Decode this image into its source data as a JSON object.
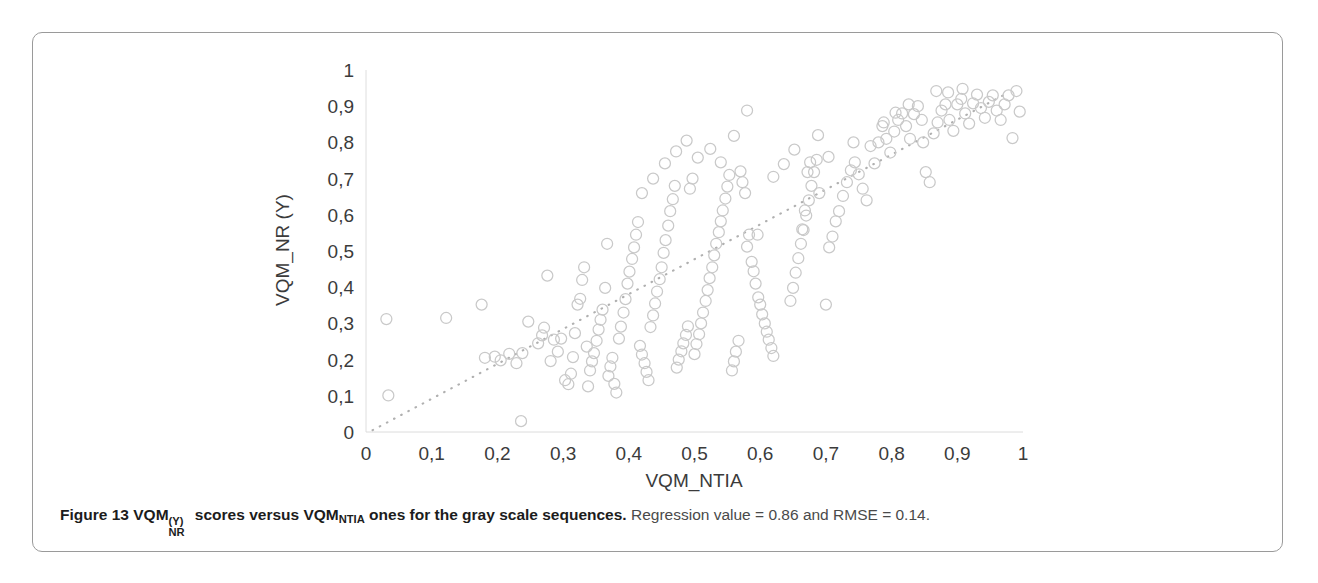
{
  "figure": {
    "caption_bold_prefix": "Figure 13",
    "caption_metric_main": "VQM",
    "caption_metric_sub": "NR",
    "caption_metric_sup": "(Y)",
    "caption_mid": " scores versus VQM",
    "caption_mid_sub": "NTIA",
    "caption_bold_tail": " ones for the gray scale sequences.",
    "caption_rest": " Regression value = 0.86 and RMSE = 0.14."
  },
  "chart_data": {
    "type": "scatter",
    "title": "",
    "xlabel": "VQM_NTIA",
    "ylabel": "VQM_NR (Y)",
    "xlim": [
      0,
      1
    ],
    "ylim": [
      0,
      1
    ],
    "xticks": [
      "0",
      "0,1",
      "0,2",
      "0,3",
      "0,4",
      "0,5",
      "0,6",
      "0,7",
      "0,8",
      "0,9",
      "1"
    ],
    "yticks": [
      "0",
      "0,1",
      "0,2",
      "0,3",
      "0,4",
      "0,5",
      "0,6",
      "0,7",
      "0,8",
      "0,9",
      "1"
    ],
    "xtick_values": [
      0,
      0.1,
      0.2,
      0.3,
      0.4,
      0.5,
      0.6,
      0.7,
      0.8,
      0.9,
      1
    ],
    "ytick_values": [
      0,
      0.1,
      0.2,
      0.3,
      0.4,
      0.5,
      0.6,
      0.7,
      0.8,
      0.9,
      1
    ],
    "grid": false,
    "legend": "none",
    "marker": "open-circle",
    "marker_color": "#c9c9c9",
    "marker_radius_px": 5.5,
    "trendline": {
      "style": "dotted",
      "color": "#b0b0b0",
      "x0": 0.01,
      "y0": 0.005,
      "x1": 0.975,
      "y1": 0.935
    },
    "annotations": {
      "regression_value": 0.86,
      "rmse": 0.14
    },
    "points": [
      [
        0.031,
        0.312
      ],
      [
        0.034,
        0.101
      ],
      [
        0.122,
        0.315
      ],
      [
        0.176,
        0.352
      ],
      [
        0.181,
        0.205
      ],
      [
        0.196,
        0.208
      ],
      [
        0.205,
        0.198
      ],
      [
        0.218,
        0.216
      ],
      [
        0.229,
        0.19
      ],
      [
        0.236,
        0.03
      ],
      [
        0.238,
        0.218
      ],
      [
        0.247,
        0.305
      ],
      [
        0.262,
        0.245
      ],
      [
        0.268,
        0.267
      ],
      [
        0.271,
        0.288
      ],
      [
        0.276,
        0.432
      ],
      [
        0.281,
        0.196
      ],
      [
        0.286,
        0.255
      ],
      [
        0.292,
        0.222
      ],
      [
        0.297,
        0.258
      ],
      [
        0.303,
        0.143
      ],
      [
        0.308,
        0.132
      ],
      [
        0.312,
        0.161
      ],
      [
        0.315,
        0.207
      ],
      [
        0.318,
        0.273
      ],
      [
        0.322,
        0.352
      ],
      [
        0.326,
        0.368
      ],
      [
        0.329,
        0.42
      ],
      [
        0.332,
        0.455
      ],
      [
        0.336,
        0.236
      ],
      [
        0.338,
        0.126
      ],
      [
        0.341,
        0.17
      ],
      [
        0.344,
        0.195
      ],
      [
        0.347,
        0.218
      ],
      [
        0.351,
        0.252
      ],
      [
        0.354,
        0.283
      ],
      [
        0.357,
        0.31
      ],
      [
        0.36,
        0.338
      ],
      [
        0.364,
        0.398
      ],
      [
        0.367,
        0.52
      ],
      [
        0.369,
        0.155
      ],
      [
        0.372,
        0.181
      ],
      [
        0.375,
        0.205
      ],
      [
        0.378,
        0.133
      ],
      [
        0.381,
        0.109
      ],
      [
        0.385,
        0.258
      ],
      [
        0.388,
        0.291
      ],
      [
        0.392,
        0.33
      ],
      [
        0.395,
        0.367
      ],
      [
        0.398,
        0.41
      ],
      [
        0.401,
        0.443
      ],
      [
        0.405,
        0.478
      ],
      [
        0.408,
        0.51
      ],
      [
        0.411,
        0.545
      ],
      [
        0.414,
        0.58
      ],
      [
        0.417,
        0.238
      ],
      [
        0.42,
        0.214
      ],
      [
        0.424,
        0.19
      ],
      [
        0.427,
        0.166
      ],
      [
        0.43,
        0.143
      ],
      [
        0.433,
        0.29
      ],
      [
        0.437,
        0.322
      ],
      [
        0.44,
        0.355
      ],
      [
        0.443,
        0.388
      ],
      [
        0.447,
        0.422
      ],
      [
        0.45,
        0.455
      ],
      [
        0.453,
        0.495
      ],
      [
        0.456,
        0.53
      ],
      [
        0.46,
        0.57
      ],
      [
        0.463,
        0.61
      ],
      [
        0.467,
        0.643
      ],
      [
        0.47,
        0.68
      ],
      [
        0.473,
        0.178
      ],
      [
        0.476,
        0.2
      ],
      [
        0.48,
        0.223
      ],
      [
        0.483,
        0.245
      ],
      [
        0.487,
        0.268
      ],
      [
        0.49,
        0.292
      ],
      [
        0.493,
        0.672
      ],
      [
        0.497,
        0.7
      ],
      [
        0.5,
        0.215
      ],
      [
        0.503,
        0.243
      ],
      [
        0.507,
        0.27
      ],
      [
        0.51,
        0.3
      ],
      [
        0.513,
        0.33
      ],
      [
        0.517,
        0.362
      ],
      [
        0.52,
        0.392
      ],
      [
        0.523,
        0.425
      ],
      [
        0.527,
        0.455
      ],
      [
        0.53,
        0.488
      ],
      [
        0.533,
        0.52
      ],
      [
        0.537,
        0.552
      ],
      [
        0.54,
        0.582
      ],
      [
        0.543,
        0.612
      ],
      [
        0.547,
        0.645
      ],
      [
        0.55,
        0.678
      ],
      [
        0.553,
        0.71
      ],
      [
        0.557,
        0.17
      ],
      [
        0.56,
        0.195
      ],
      [
        0.563,
        0.222
      ],
      [
        0.567,
        0.252
      ],
      [
        0.57,
        0.72
      ],
      [
        0.573,
        0.69
      ],
      [
        0.577,
        0.66
      ],
      [
        0.58,
        0.512
      ],
      [
        0.583,
        0.545
      ],
      [
        0.587,
        0.47
      ],
      [
        0.59,
        0.444
      ],
      [
        0.593,
        0.41
      ],
      [
        0.597,
        0.372
      ],
      [
        0.6,
        0.352
      ],
      [
        0.603,
        0.325
      ],
      [
        0.607,
        0.3
      ],
      [
        0.61,
        0.277
      ],
      [
        0.613,
        0.255
      ],
      [
        0.617,
        0.232
      ],
      [
        0.62,
        0.21
      ],
      [
        0.58,
        0.888
      ],
      [
        0.596,
        0.545
      ],
      [
        0.56,
        0.818
      ],
      [
        0.54,
        0.745
      ],
      [
        0.524,
        0.782
      ],
      [
        0.505,
        0.758
      ],
      [
        0.488,
        0.805
      ],
      [
        0.472,
        0.775
      ],
      [
        0.455,
        0.742
      ],
      [
        0.437,
        0.7
      ],
      [
        0.42,
        0.66
      ],
      [
        0.646,
        0.362
      ],
      [
        0.65,
        0.398
      ],
      [
        0.654,
        0.44
      ],
      [
        0.658,
        0.48
      ],
      [
        0.662,
        0.52
      ],
      [
        0.666,
        0.558
      ],
      [
        0.67,
        0.598
      ],
      [
        0.674,
        0.64
      ],
      [
        0.678,
        0.68
      ],
      [
        0.682,
        0.718
      ],
      [
        0.686,
        0.752
      ],
      [
        0.69,
        0.66
      ],
      [
        0.664,
        0.56
      ],
      [
        0.668,
        0.612
      ],
      [
        0.672,
        0.718
      ],
      [
        0.676,
        0.745
      ],
      [
        0.7,
        0.352
      ],
      [
        0.705,
        0.51
      ],
      [
        0.71,
        0.54
      ],
      [
        0.715,
        0.582
      ],
      [
        0.72,
        0.61
      ],
      [
        0.726,
        0.652
      ],
      [
        0.732,
        0.69
      ],
      [
        0.738,
        0.723
      ],
      [
        0.744,
        0.745
      ],
      [
        0.75,
        0.712
      ],
      [
        0.756,
        0.672
      ],
      [
        0.762,
        0.64
      ],
      [
        0.768,
        0.79
      ],
      [
        0.774,
        0.742
      ],
      [
        0.78,
        0.8
      ],
      [
        0.786,
        0.845
      ],
      [
        0.792,
        0.81
      ],
      [
        0.798,
        0.772
      ],
      [
        0.804,
        0.83
      ],
      [
        0.81,
        0.862
      ],
      [
        0.816,
        0.88
      ],
      [
        0.822,
        0.845
      ],
      [
        0.828,
        0.81
      ],
      [
        0.834,
        0.878
      ],
      [
        0.84,
        0.9
      ],
      [
        0.846,
        0.862
      ],
      [
        0.852,
        0.718
      ],
      [
        0.858,
        0.69
      ],
      [
        0.864,
        0.825
      ],
      [
        0.87,
        0.855
      ],
      [
        0.876,
        0.888
      ],
      [
        0.882,
        0.905
      ],
      [
        0.888,
        0.862
      ],
      [
        0.894,
        0.832
      ],
      [
        0.9,
        0.905
      ],
      [
        0.906,
        0.92
      ],
      [
        0.912,
        0.88
      ],
      [
        0.918,
        0.852
      ],
      [
        0.924,
        0.908
      ],
      [
        0.93,
        0.932
      ],
      [
        0.936,
        0.895
      ],
      [
        0.942,
        0.868
      ],
      [
        0.948,
        0.912
      ],
      [
        0.954,
        0.93
      ],
      [
        0.96,
        0.888
      ],
      [
        0.966,
        0.862
      ],
      [
        0.972,
        0.905
      ],
      [
        0.978,
        0.93
      ],
      [
        0.984,
        0.812
      ],
      [
        0.99,
        0.942
      ],
      [
        0.995,
        0.885
      ],
      [
        0.868,
        0.942
      ],
      [
        0.886,
        0.938
      ],
      [
        0.908,
        0.948
      ],
      [
        0.826,
        0.905
      ],
      [
        0.806,
        0.882
      ],
      [
        0.848,
        0.8
      ],
      [
        0.788,
        0.855
      ],
      [
        0.742,
        0.8
      ],
      [
        0.704,
        0.76
      ],
      [
        0.688,
        0.82
      ],
      [
        0.652,
        0.78
      ],
      [
        0.636,
        0.74
      ],
      [
        0.62,
        0.705
      ]
    ]
  }
}
